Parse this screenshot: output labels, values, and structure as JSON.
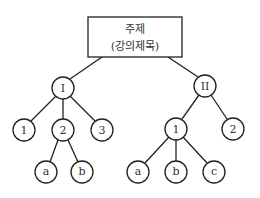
{
  "diagram": {
    "type": "tree",
    "root": {
      "line1": "주제",
      "line2": "(강의제목)"
    },
    "nodes": {
      "I": "I",
      "II": "II",
      "I_1": "1",
      "I_2": "2",
      "I_3": "3",
      "I_2_a": "a",
      "I_2_b": "b",
      "II_1": "1",
      "II_2": "2",
      "II_1_a": "a",
      "II_1_b": "b",
      "II_1_c": "c"
    },
    "colors": {
      "stroke": "#222222",
      "text": "#333333",
      "background": "#ffffff"
    }
  }
}
